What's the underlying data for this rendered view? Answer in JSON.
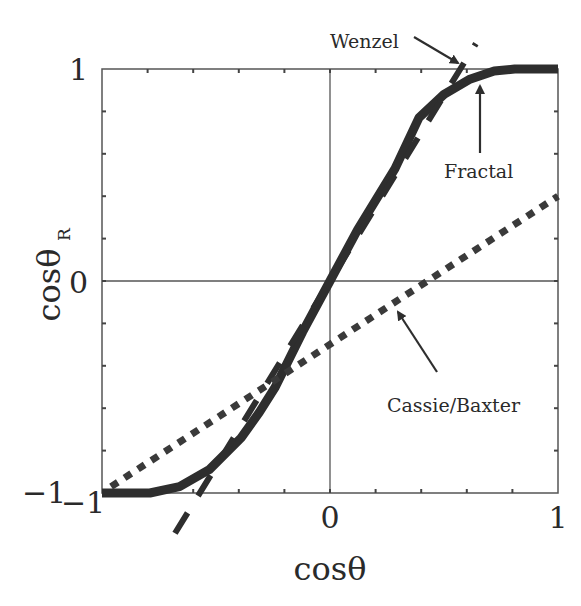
{
  "chart_data": {
    "type": "line",
    "title": "",
    "xlabel": "cosθ",
    "ylabel": "cosθ_R",
    "ylabel_main": "cosθ",
    "ylabel_sub": "R",
    "xlim": [
      -1,
      1
    ],
    "ylim": [
      -1,
      1
    ],
    "x_ticks": [
      -1,
      0,
      1
    ],
    "y_ticks": [
      -1,
      0,
      1
    ],
    "x_tick_labels": [
      "−1",
      "0",
      "1"
    ],
    "y_tick_labels": [
      "−1",
      "0",
      "1"
    ],
    "minor_tick_step": 0.2,
    "grid": false,
    "zero_lines": true,
    "legend": "none (inline annotations)",
    "series": [
      {
        "name": "Wenzel",
        "style": "dashed",
        "equation": "cosθ_R = 1.75·cosθ",
        "x": [
          -0.68,
          0.64
        ],
        "y": [
          -1.19,
          1.12
        ]
      },
      {
        "name": "Fractal",
        "style": "solid-thick",
        "x": [
          -1.0,
          -0.79,
          -0.66,
          -0.53,
          -0.39,
          -0.31,
          -0.24,
          -0.12,
          0.0,
          0.12,
          0.285,
          0.39,
          0.5,
          0.61,
          0.72,
          0.81,
          1.0
        ],
        "y": [
          -1.0,
          -1.0,
          -0.97,
          -0.89,
          -0.74,
          -0.62,
          -0.5,
          -0.24,
          0.0,
          0.24,
          0.53,
          0.77,
          0.88,
          0.95,
          0.99,
          1.0,
          1.0
        ]
      },
      {
        "name": "Cassie/Baxter",
        "style": "dotted",
        "equation": "cosθ_R ≈ 0.7·cosθ − 0.3",
        "x": [
          -0.96,
          1.0
        ],
        "y": [
          -0.97,
          0.4
        ]
      }
    ],
    "annotations": [
      {
        "text": "Wenzel",
        "points_to": [
          0.57,
          1.0
        ]
      },
      {
        "text": "Fractal",
        "points_to": [
          0.66,
          0.95
        ]
      },
      {
        "text": "Cassie/Baxter",
        "points_to": [
          0.3,
          -0.1
        ]
      }
    ]
  },
  "labels": {
    "wenzel": "Wenzel",
    "fractal": "Fractal",
    "cassie": "Cassie/Baxter",
    "xlabel": "cosθ",
    "ylabel_main": "cosθ",
    "ylabel_sub": "R",
    "xt_neg1": "−1",
    "xt_0": "0",
    "xt_1": "1",
    "yt_neg1": "−1",
    "yt_0": "0",
    "yt_1": "1"
  },
  "colors": {
    "line": "#2e2e2e",
    "frame": "#555555",
    "text": "#2a2a2a"
  }
}
